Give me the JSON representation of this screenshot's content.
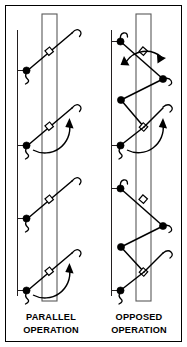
{
  "figure": {
    "background_color": "#ffffff",
    "line_color": "#000000",
    "bar_color": "#5a5a5a",
    "width": 187,
    "height": 347
  },
  "captions": {
    "left": {
      "line1": "PARALLEL",
      "line2": "OPERATION"
    },
    "right": {
      "line1": "OPPOSED",
      "line2": "OPERATION"
    }
  },
  "columns": [
    {
      "id": "parallel",
      "label": "PARALLEL OPERATION",
      "bar": {
        "x": 42,
        "y": 14,
        "width": 15,
        "height": 287
      },
      "rail_x": 17,
      "rail_top": 30,
      "rail_bottom": 296,
      "units": [
        {
          "index": 1,
          "pivot_y": 52,
          "pin_y": 73,
          "has_arc": false,
          "direction": "up-right"
        },
        {
          "index": 2,
          "pivot_y": 127,
          "pin_y": 148,
          "has_arc": true,
          "direction": "up-right"
        },
        {
          "index": 3,
          "pivot_y": 200,
          "pin_y": 221,
          "has_arc": false,
          "direction": "up-right"
        },
        {
          "index": 4,
          "pivot_y": 272,
          "pin_y": 293,
          "has_arc": true,
          "direction": "up-right"
        }
      ]
    },
    {
      "id": "opposed",
      "label": "OPPOSED OPERATION",
      "bar": {
        "x": 136,
        "y": 14,
        "width": 15,
        "height": 287
      },
      "rail_x": 111,
      "units": [
        {
          "index": 1,
          "pivot_y": 52,
          "pin_y": 42,
          "has_arc": true,
          "arc_double": true,
          "direction": "zigzag"
        },
        {
          "index": 2,
          "pivot_y": 127,
          "pin_y": 140,
          "has_arc": true,
          "direction": "up-right"
        },
        {
          "index": 3,
          "pivot_y": 200,
          "pin_y": 188,
          "has_arc": false,
          "direction": "zigzag"
        },
        {
          "index": 4,
          "pivot_y": 272,
          "pin_y": 285,
          "has_arc": false,
          "direction": "up-right"
        }
      ]
    }
  ],
  "legend": {
    "pivot_symbol": "hollow-square",
    "pin_symbol": "filled-circle",
    "arrow_symbol": "curved-rotation-arrow"
  }
}
